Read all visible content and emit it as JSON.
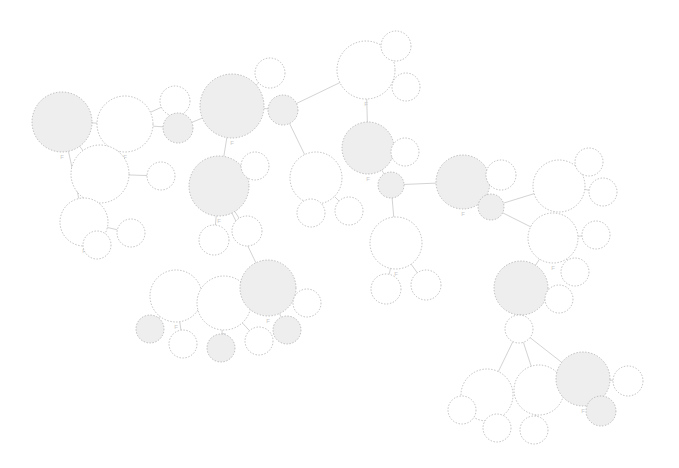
{
  "view": {
    "title": "Image similarity graph",
    "background_color": "#ffffff",
    "width": 679,
    "height": 468,
    "node_label_text": "F",
    "node_stroke_color": "#9a9a9a",
    "node_fill_highlight": "#eeeeee",
    "node_fill_plain": "#ffffff",
    "edge_color": "#a8a8a8",
    "thumbnail_kind": "chromosome-spread-thumbnail"
  },
  "graph_data": {
    "type": "node-link-graph",
    "node_count": 52,
    "edge_count": 45,
    "layout": "force-directed",
    "nodes": [
      {
        "id": "n1",
        "cx": 62,
        "cy": 122,
        "r": 30,
        "fill": "highlight",
        "label": "F",
        "thumb": 0,
        "tw": 40,
        "th": 20,
        "rot": -4,
        "dens": 0.78,
        "tone": 0.55
      },
      {
        "id": "n2",
        "cx": 125,
        "cy": 124,
        "r": 28,
        "fill": "plain",
        "label": "F",
        "thumb": 1,
        "tw": 38,
        "th": 22,
        "rot": 3,
        "dens": 0.92,
        "tone": 0.3
      },
      {
        "id": "n3",
        "cx": 175,
        "cy": 101,
        "r": 15,
        "fill": "plain",
        "label": "",
        "thumb": 2,
        "tw": 20,
        "th": 10,
        "rot": -14,
        "dens": 0.85,
        "tone": 0.35
      },
      {
        "id": "n4",
        "cx": 178,
        "cy": 128,
        "r": 15,
        "fill": "highlight",
        "label": "",
        "thumb": 3,
        "tw": 20,
        "th": 11,
        "rot": 2,
        "dens": 0.5,
        "tone": 0.62
      },
      {
        "id": "n5",
        "cx": 100,
        "cy": 174,
        "r": 29,
        "fill": "plain",
        "label": "F",
        "thumb": 4,
        "tw": 40,
        "th": 21,
        "rot": 2,
        "dens": 0.9,
        "tone": 0.28
      },
      {
        "id": "n6",
        "cx": 161,
        "cy": 176,
        "r": 14,
        "fill": "plain",
        "label": "",
        "thumb": 5,
        "tw": 19,
        "th": 10,
        "rot": -12,
        "dens": 0.82,
        "tone": 0.36
      },
      {
        "id": "n7",
        "cx": 84,
        "cy": 222,
        "r": 24,
        "fill": "plain",
        "label": "F",
        "thumb": 6,
        "tw": 32,
        "th": 18,
        "rot": -2,
        "dens": 0.88,
        "tone": 0.3
      },
      {
        "id": "n8",
        "cx": 97,
        "cy": 245,
        "r": 14,
        "fill": "plain",
        "label": "",
        "thumb": 7,
        "tw": 19,
        "th": 10,
        "rot": 1,
        "dens": 0.55,
        "tone": 0.58
      },
      {
        "id": "n9",
        "cx": 131,
        "cy": 233,
        "r": 14,
        "fill": "plain",
        "label": "",
        "thumb": 8,
        "tw": 19,
        "th": 10,
        "rot": -13,
        "dens": 0.84,
        "tone": 0.34
      },
      {
        "id": "n10",
        "cx": 232,
        "cy": 106,
        "r": 32,
        "fill": "highlight",
        "label": "F",
        "thumb": 9,
        "tw": 44,
        "th": 24,
        "rot": 1,
        "dens": 0.93,
        "tone": 0.26
      },
      {
        "id": "n11",
        "cx": 270,
        "cy": 73,
        "r": 15,
        "fill": "plain",
        "label": "",
        "thumb": 10,
        "tw": 20,
        "th": 11,
        "rot": -13,
        "dens": 0.86,
        "tone": 0.33
      },
      {
        "id": "n12",
        "cx": 283,
        "cy": 110,
        "r": 15,
        "fill": "highlight",
        "label": "",
        "thumb": 11,
        "tw": 21,
        "th": 11,
        "rot": 1,
        "dens": 0.48,
        "tone": 0.64
      },
      {
        "id": "n13",
        "cx": 219,
        "cy": 186,
        "r": 30,
        "fill": "highlight",
        "label": "F",
        "thumb": 12,
        "tw": 41,
        "th": 22,
        "rot": 2,
        "dens": 0.91,
        "tone": 0.28
      },
      {
        "id": "n14",
        "cx": 255,
        "cy": 166,
        "r": 14,
        "fill": "plain",
        "label": "",
        "thumb": 13,
        "tw": 19,
        "th": 10,
        "rot": -14,
        "dens": 0.83,
        "tone": 0.35
      },
      {
        "id": "n15",
        "cx": 214,
        "cy": 240,
        "r": 15,
        "fill": "plain",
        "label": "",
        "thumb": 14,
        "tw": 20,
        "th": 11,
        "rot": 1,
        "dens": 0.52,
        "tone": 0.6
      },
      {
        "id": "n16",
        "cx": 247,
        "cy": 231,
        "r": 15,
        "fill": "plain",
        "label": "",
        "thumb": 15,
        "tw": 20,
        "th": 10,
        "rot": -13,
        "dens": 0.85,
        "tone": 0.34
      },
      {
        "id": "n17",
        "cx": 316,
        "cy": 178,
        "r": 26,
        "fill": "plain",
        "label": "F",
        "thumb": 16,
        "tw": 36,
        "th": 19,
        "rot": 2,
        "dens": 0.9,
        "tone": 0.29
      },
      {
        "id": "n18",
        "cx": 311,
        "cy": 213,
        "r": 14,
        "fill": "plain",
        "label": "",
        "thumb": 17,
        "tw": 19,
        "th": 10,
        "rot": 1,
        "dens": 0.5,
        "tone": 0.63
      },
      {
        "id": "n19",
        "cx": 349,
        "cy": 211,
        "r": 14,
        "fill": "plain",
        "label": "",
        "thumb": 18,
        "tw": 19,
        "th": 10,
        "rot": -12,
        "dens": 0.84,
        "tone": 0.34
      },
      {
        "id": "n20",
        "cx": 366,
        "cy": 70,
        "r": 29,
        "fill": "plain",
        "label": "F",
        "thumb": 19,
        "tw": 40,
        "th": 21,
        "rot": 1,
        "dens": 0.89,
        "tone": 0.3
      },
      {
        "id": "n21",
        "cx": 396,
        "cy": 46,
        "r": 15,
        "fill": "plain",
        "label": "",
        "thumb": 20,
        "tw": 20,
        "th": 10,
        "rot": -14,
        "dens": 0.85,
        "tone": 0.33
      },
      {
        "id": "n22",
        "cx": 406,
        "cy": 87,
        "r": 14,
        "fill": "plain",
        "label": "",
        "thumb": 21,
        "tw": 19,
        "th": 10,
        "rot": 1,
        "dens": 0.5,
        "tone": 0.62
      },
      {
        "id": "n23",
        "cx": 368,
        "cy": 148,
        "r": 26,
        "fill": "highlight",
        "label": "F",
        "thumb": 22,
        "tw": 36,
        "th": 19,
        "rot": 2,
        "dens": 0.91,
        "tone": 0.27
      },
      {
        "id": "n24",
        "cx": 405,
        "cy": 152,
        "r": 14,
        "fill": "plain",
        "label": "",
        "thumb": 23,
        "tw": 19,
        "th": 10,
        "rot": -13,
        "dens": 0.84,
        "tone": 0.35
      },
      {
        "id": "n25",
        "cx": 391,
        "cy": 185,
        "r": 13,
        "fill": "highlight",
        "label": "",
        "thumb": 24,
        "tw": 18,
        "th": 10,
        "rot": 1,
        "dens": 0.46,
        "tone": 0.66
      },
      {
        "id": "n26",
        "cx": 396,
        "cy": 243,
        "r": 26,
        "fill": "plain",
        "label": "F",
        "thumb": 25,
        "tw": 36,
        "th": 19,
        "rot": 2,
        "dens": 0.9,
        "tone": 0.29
      },
      {
        "id": "n27",
        "cx": 386,
        "cy": 289,
        "r": 15,
        "fill": "plain",
        "label": "",
        "thumb": 26,
        "tw": 20,
        "th": 11,
        "rot": 1,
        "dens": 0.48,
        "tone": 0.64
      },
      {
        "id": "n28",
        "cx": 426,
        "cy": 285,
        "r": 15,
        "fill": "plain",
        "label": "",
        "thumb": 27,
        "tw": 20,
        "th": 10,
        "rot": -13,
        "dens": 0.84,
        "tone": 0.34
      },
      {
        "id": "n29",
        "cx": 463,
        "cy": 182,
        "r": 27,
        "fill": "highlight",
        "label": "F",
        "thumb": 28,
        "tw": 37,
        "th": 20,
        "rot": 1,
        "dens": 0.92,
        "tone": 0.27
      },
      {
        "id": "n30",
        "cx": 501,
        "cy": 175,
        "r": 15,
        "fill": "plain",
        "label": "",
        "thumb": 29,
        "tw": 20,
        "th": 10,
        "rot": -13,
        "dens": 0.85,
        "tone": 0.33
      },
      {
        "id": "n31",
        "cx": 491,
        "cy": 207,
        "r": 13,
        "fill": "highlight",
        "label": "",
        "thumb": 30,
        "tw": 18,
        "th": 10,
        "rot": 1,
        "dens": 0.47,
        "tone": 0.65
      },
      {
        "id": "n32",
        "cx": 559,
        "cy": 186,
        "r": 26,
        "fill": "plain",
        "label": "F",
        "thumb": 31,
        "tw": 36,
        "th": 19,
        "rot": 2,
        "dens": 0.91,
        "tone": 0.28
      },
      {
        "id": "n33",
        "cx": 589,
        "cy": 162,
        "r": 14,
        "fill": "plain",
        "label": "",
        "thumb": 32,
        "tw": 19,
        "th": 10,
        "rot": -14,
        "dens": 0.85,
        "tone": 0.33
      },
      {
        "id": "n34",
        "cx": 603,
        "cy": 192,
        "r": 14,
        "fill": "plain",
        "label": "",
        "thumb": 33,
        "tw": 19,
        "th": 10,
        "rot": 1,
        "dens": 0.48,
        "tone": 0.64
      },
      {
        "id": "n35",
        "cx": 553,
        "cy": 238,
        "r": 25,
        "fill": "plain",
        "label": "F",
        "thumb": 34,
        "tw": 34,
        "th": 18,
        "rot": 2,
        "dens": 0.9,
        "tone": 0.29
      },
      {
        "id": "n36",
        "cx": 596,
        "cy": 235,
        "r": 14,
        "fill": "plain",
        "label": "",
        "thumb": 35,
        "tw": 19,
        "th": 10,
        "rot": -12,
        "dens": 0.84,
        "tone": 0.34
      },
      {
        "id": "n37",
        "cx": 575,
        "cy": 272,
        "r": 14,
        "fill": "plain",
        "label": "",
        "thumb": 36,
        "tw": 19,
        "th": 10,
        "rot": 1,
        "dens": 0.47,
        "tone": 0.65
      },
      {
        "id": "n38",
        "cx": 521,
        "cy": 288,
        "r": 27,
        "fill": "highlight",
        "label": "F",
        "thumb": 37,
        "tw": 37,
        "th": 21,
        "rot": 1,
        "dens": 0.93,
        "tone": 0.26
      },
      {
        "id": "n39",
        "cx": 559,
        "cy": 299,
        "r": 14,
        "fill": "plain",
        "label": "",
        "thumb": 38,
        "tw": 19,
        "th": 10,
        "rot": -13,
        "dens": 0.84,
        "tone": 0.35
      },
      {
        "id": "n40",
        "cx": 519,
        "cy": 329,
        "r": 14,
        "fill": "plain",
        "label": "",
        "thumb": 39,
        "tw": 19,
        "th": 10,
        "rot": 1,
        "dens": 0.49,
        "tone": 0.63
      },
      {
        "id": "n41",
        "cx": 176,
        "cy": 296,
        "r": 26,
        "fill": "plain",
        "label": "F",
        "thumb": 40,
        "tw": 36,
        "th": 19,
        "rot": 2,
        "dens": 0.9,
        "tone": 0.28
      },
      {
        "id": "n42",
        "cx": 150,
        "cy": 329,
        "r": 14,
        "fill": "highlight",
        "label": "",
        "thumb": 41,
        "tw": 19,
        "th": 10,
        "rot": 1,
        "dens": 0.49,
        "tone": 0.63
      },
      {
        "id": "n43",
        "cx": 183,
        "cy": 344,
        "r": 14,
        "fill": "plain",
        "label": "",
        "thumb": 42,
        "tw": 19,
        "th": 10,
        "rot": -13,
        "dens": 0.84,
        "tone": 0.34
      },
      {
        "id": "n44",
        "cx": 224,
        "cy": 303,
        "r": 27,
        "fill": "plain",
        "label": "F",
        "thumb": 43,
        "tw": 37,
        "th": 20,
        "rot": 2,
        "dens": 0.91,
        "tone": 0.27
      },
      {
        "id": "n45",
        "cx": 221,
        "cy": 348,
        "r": 14,
        "fill": "highlight",
        "label": "",
        "thumb": 44,
        "tw": 19,
        "th": 10,
        "rot": 1,
        "dens": 0.48,
        "tone": 0.64
      },
      {
        "id": "n46",
        "cx": 259,
        "cy": 341,
        "r": 14,
        "fill": "plain",
        "label": "",
        "thumb": 45,
        "tw": 19,
        "th": 10,
        "rot": -12,
        "dens": 0.85,
        "tone": 0.33
      },
      {
        "id": "n47",
        "cx": 268,
        "cy": 288,
        "r": 28,
        "fill": "highlight",
        "label": "F",
        "thumb": 46,
        "tw": 38,
        "th": 21,
        "rot": 1,
        "dens": 0.92,
        "tone": 0.27
      },
      {
        "id": "n48",
        "cx": 307,
        "cy": 303,
        "r": 14,
        "fill": "plain",
        "label": "",
        "thumb": 47,
        "tw": 19,
        "th": 10,
        "rot": -13,
        "dens": 0.84,
        "tone": 0.34
      },
      {
        "id": "n49",
        "cx": 287,
        "cy": 330,
        "r": 14,
        "fill": "highlight",
        "label": "",
        "thumb": 48,
        "tw": 19,
        "th": 10,
        "rot": 1,
        "dens": 0.47,
        "tone": 0.65
      },
      {
        "id": "n50",
        "cx": 487,
        "cy": 395,
        "r": 26,
        "fill": "plain",
        "label": "F",
        "thumb": 49,
        "tw": 36,
        "th": 19,
        "rot": 2,
        "dens": 0.9,
        "tone": 0.28
      },
      {
        "id": "n51",
        "cx": 462,
        "cy": 410,
        "r": 14,
        "fill": "plain",
        "label": "",
        "thumb": 50,
        "tw": 19,
        "th": 10,
        "rot": 1,
        "dens": 0.48,
        "tone": 0.64
      },
      {
        "id": "n52",
        "cx": 497,
        "cy": 428,
        "r": 14,
        "fill": "plain",
        "label": "",
        "thumb": 51,
        "tw": 19,
        "th": 10,
        "rot": -13,
        "dens": 0.84,
        "tone": 0.34
      },
      {
        "id": "n53",
        "cx": 539,
        "cy": 390,
        "r": 25,
        "fill": "plain",
        "label": "F",
        "thumb": 52,
        "tw": 34,
        "th": 18,
        "rot": 2,
        "dens": 0.91,
        "tone": 0.27
      },
      {
        "id": "n54",
        "cx": 534,
        "cy": 430,
        "r": 14,
        "fill": "plain",
        "label": "",
        "thumb": 53,
        "tw": 19,
        "th": 10,
        "rot": -12,
        "dens": 0.85,
        "tone": 0.33
      },
      {
        "id": "n55",
        "cx": 583,
        "cy": 379,
        "r": 27,
        "fill": "highlight",
        "label": "F",
        "thumb": 54,
        "tw": 37,
        "th": 21,
        "rot": 1,
        "dens": 0.93,
        "tone": 0.26
      },
      {
        "id": "n56",
        "cx": 628,
        "cy": 381,
        "r": 15,
        "fill": "plain",
        "label": "",
        "thumb": 55,
        "tw": 20,
        "th": 11,
        "rot": -13,
        "dens": 0.85,
        "tone": 0.33
      },
      {
        "id": "n57",
        "cx": 601,
        "cy": 411,
        "r": 15,
        "fill": "highlight",
        "label": "",
        "thumb": 56,
        "tw": 20,
        "th": 11,
        "rot": 1,
        "dens": 0.47,
        "tone": 0.65
      }
    ],
    "edges": [
      {
        "source": "n1",
        "target": "n2"
      },
      {
        "source": "n1",
        "target": "n5"
      },
      {
        "source": "n1",
        "target": "n7"
      },
      {
        "source": "n2",
        "target": "n3"
      },
      {
        "source": "n2",
        "target": "n4"
      },
      {
        "source": "n2",
        "target": "n5"
      },
      {
        "source": "n5",
        "target": "n6"
      },
      {
        "source": "n5",
        "target": "n7"
      },
      {
        "source": "n7",
        "target": "n8"
      },
      {
        "source": "n7",
        "target": "n9"
      },
      {
        "source": "n10",
        "target": "n11"
      },
      {
        "source": "n10",
        "target": "n12"
      },
      {
        "source": "n10",
        "target": "n4"
      },
      {
        "source": "n10",
        "target": "n13"
      },
      {
        "source": "n13",
        "target": "n14"
      },
      {
        "source": "n13",
        "target": "n15"
      },
      {
        "source": "n13",
        "target": "n16"
      },
      {
        "source": "n12",
        "target": "n17"
      },
      {
        "source": "n12",
        "target": "n20"
      },
      {
        "source": "n17",
        "target": "n18"
      },
      {
        "source": "n17",
        "target": "n19"
      },
      {
        "source": "n20",
        "target": "n21"
      },
      {
        "source": "n20",
        "target": "n22"
      },
      {
        "source": "n20",
        "target": "n23"
      },
      {
        "source": "n23",
        "target": "n24"
      },
      {
        "source": "n23",
        "target": "n25"
      },
      {
        "source": "n25",
        "target": "n26"
      },
      {
        "source": "n25",
        "target": "n29"
      },
      {
        "source": "n26",
        "target": "n27"
      },
      {
        "source": "n26",
        "target": "n28"
      },
      {
        "source": "n29",
        "target": "n30"
      },
      {
        "source": "n29",
        "target": "n31"
      },
      {
        "source": "n31",
        "target": "n32"
      },
      {
        "source": "n31",
        "target": "n35"
      },
      {
        "source": "n32",
        "target": "n33"
      },
      {
        "source": "n32",
        "target": "n34"
      },
      {
        "source": "n35",
        "target": "n36"
      },
      {
        "source": "n35",
        "target": "n37"
      },
      {
        "source": "n35",
        "target": "n38"
      },
      {
        "source": "n38",
        "target": "n39"
      },
      {
        "source": "n38",
        "target": "n40"
      },
      {
        "source": "n40",
        "target": "n50"
      },
      {
        "source": "n40",
        "target": "n53"
      },
      {
        "source": "n40",
        "target": "n55"
      },
      {
        "source": "n50",
        "target": "n51"
      },
      {
        "source": "n50",
        "target": "n52"
      },
      {
        "source": "n53",
        "target": "n54"
      },
      {
        "source": "n55",
        "target": "n56"
      },
      {
        "source": "n55",
        "target": "n57"
      },
      {
        "source": "n13",
        "target": "n47"
      },
      {
        "source": "n47",
        "target": "n41"
      },
      {
        "source": "n47",
        "target": "n44"
      },
      {
        "source": "n47",
        "target": "n48"
      },
      {
        "source": "n47",
        "target": "n49"
      },
      {
        "source": "n41",
        "target": "n42"
      },
      {
        "source": "n41",
        "target": "n43"
      },
      {
        "source": "n44",
        "target": "n45"
      },
      {
        "source": "n44",
        "target": "n46"
      }
    ]
  }
}
